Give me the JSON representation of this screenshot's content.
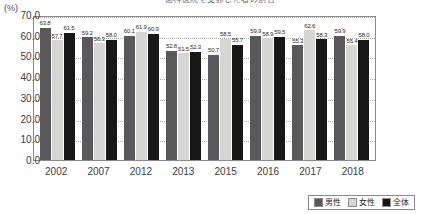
{
  "axis_unit": "(%)",
  "title_fragment": "歯科医院を受診した者の割合",
  "legend": {
    "items": [
      {
        "label": "男性",
        "color": "#59595b",
        "swatch": "male-swatch"
      },
      {
        "label": "女性",
        "color": "#d6d6d4",
        "swatch": "female-swatch"
      },
      {
        "label": "全体",
        "color": "#171717",
        "swatch": "total-swatch"
      }
    ]
  },
  "chart_data": {
    "type": "bar",
    "title": "歯科医院を受診した者の割合",
    "xlabel": "",
    "ylabel": "(%)",
    "ylim": [
      0.0,
      70.0
    ],
    "ytick_step": 10.0,
    "grid": true,
    "legend_position": "bottom-right",
    "categories": [
      "2002",
      "2007",
      "2012",
      "2013",
      "2015",
      "2016",
      "2017",
      "2018"
    ],
    "ytick_labels": [
      "70.0",
      "60.0",
      "50.0",
      "40.0",
      "30.0",
      "20.0",
      "10.0",
      "0.0"
    ],
    "series": [
      {
        "name": "男性",
        "color": "#59595b",
        "values": [
          63.8,
          59.2,
          60.1,
          52.8,
          50.7,
          59.9,
          55.3,
          59.9
        ]
      },
      {
        "name": "女性",
        "color": "#d6d6d4",
        "values": [
          57.7,
          56.3,
          61.9,
          51.5,
          58.5,
          58.9,
          62.6,
          55.4
        ]
      },
      {
        "name": "全体",
        "color": "#171717",
        "values": [
          61.5,
          58.0,
          60.9,
          52.3,
          55.7,
          59.5,
          58.3,
          58.0
        ]
      }
    ],
    "data_labels": [
      [
        "63.8",
        "57.7",
        "61.5"
      ],
      [
        "59.2",
        "56.3",
        "58.0"
      ],
      [
        "60.1",
        "61.9",
        "60.9"
      ],
      [
        "52.8",
        "51.5",
        "52.3"
      ],
      [
        "50.7",
        "58.5",
        "55.7"
      ],
      [
        "59.9",
        "58.9",
        "59.5"
      ],
      [
        "55.3",
        "62.6",
        "58.3"
      ],
      [
        "59.9",
        "55.4",
        "58.0"
      ]
    ]
  }
}
